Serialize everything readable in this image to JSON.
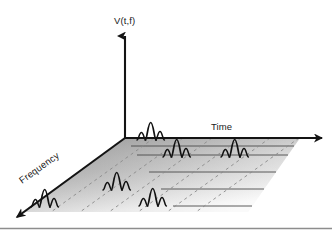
{
  "figure": {
    "kind": "3d-time-frequency-plane-diagram",
    "background_color": "#ffffff",
    "width": 332,
    "height": 232
  },
  "axes": {
    "vertical": {
      "label": "V(t,f)",
      "name": "amplitude-axis",
      "color": "#141414"
    },
    "horizontal": {
      "label": "Time",
      "name": "time-axis",
      "color": "#141414"
    },
    "depth": {
      "label": "Frequency",
      "name": "frequency-axis",
      "color": "#141414"
    }
  },
  "plane": {
    "fill_light": "#f2f2f2",
    "fill_mid": "#bdbdbd",
    "fill_dark": "#8f8f8f",
    "solid_gridline_color": "#4a4a4a",
    "dashed_gridline_color": "#8a8a8a",
    "solid_gridline_count": 5,
    "dashed_gridline_count": 6
  },
  "wavelets": {
    "stroke_color": "#111111",
    "count": 6,
    "items": [
      {
        "id": "wavelet-1",
        "row": 1,
        "col": 2
      },
      {
        "id": "wavelet-2",
        "row": 2,
        "col": 3
      },
      {
        "id": "wavelet-3",
        "row": 2,
        "col": 5
      },
      {
        "id": "wavelet-4",
        "row": 4,
        "col": 2
      },
      {
        "id": "wavelet-5",
        "row": 5,
        "col": 3
      },
      {
        "id": "wavelet-6",
        "row": 5,
        "col": 1
      }
    ]
  },
  "footer_rule": {
    "color": "#8d8d8d",
    "name": "bottom-divider"
  }
}
